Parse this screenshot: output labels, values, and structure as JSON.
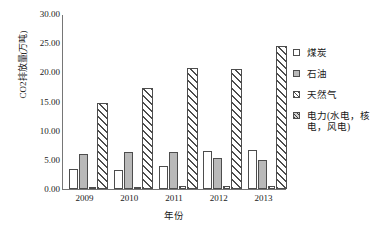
{
  "chart_data": {
    "type": "bar",
    "title": "",
    "xlabel": "年份",
    "ylabel": "CO2排放量(万吨)",
    "ylim": [
      0,
      30
    ],
    "yticks": [
      "0.00",
      "5.00",
      "10.00",
      "15.00",
      "20.00",
      "25.00",
      "30.00"
    ],
    "ytick_values": [
      0,
      5,
      10,
      15,
      20,
      25,
      30
    ],
    "grid": false,
    "legend_position": "right",
    "categories": [
      "2009",
      "2010",
      "2011",
      "2012",
      "2013"
    ],
    "series": [
      {
        "name": "煤炭",
        "values": [
          3.5,
          3.2,
          4.0,
          6.6,
          6.7
        ]
      },
      {
        "name": "石油",
        "values": [
          6.0,
          6.3,
          6.3,
          5.4,
          4.9
        ]
      },
      {
        "name": "天然气",
        "values": [
          0.05,
          0.4,
          0.5,
          0.5,
          0.5
        ]
      },
      {
        "name": "电力(水电，核电，风电)",
        "values": [
          14.8,
          17.3,
          20.7,
          20.6,
          24.5
        ]
      }
    ]
  },
  "legend": {
    "items": [
      {
        "label": "煤炭"
      },
      {
        "label": "石油"
      },
      {
        "label": "天然气"
      },
      {
        "label": "电力(水电，核\n电，风电)"
      }
    ]
  }
}
